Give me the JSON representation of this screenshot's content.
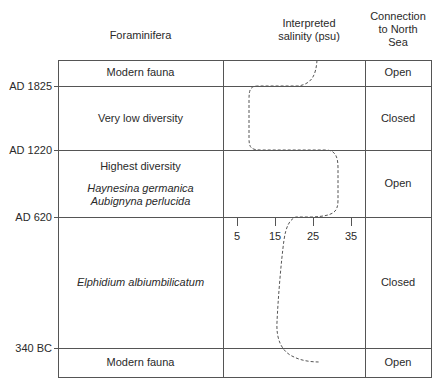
{
  "headers": {
    "foraminifera": "Foraminifera",
    "salinity_line1": "Interpreted",
    "salinity_line2": "salinity (psu)",
    "connection_line1": "Connection",
    "connection_line2": "to North",
    "connection_line3": "Sea"
  },
  "dates": {
    "d1": "AD 1825",
    "d2": "AD 1220",
    "d3": "AD 620",
    "d4": "340 BC"
  },
  "rows": [
    {
      "fauna": "Modern fauna",
      "connection": "Open"
    },
    {
      "fauna": "Very low diversity",
      "connection": "Closed"
    },
    {
      "fauna": "Highest diversity",
      "species1": "Haynesina germanica",
      "species2": "Aubignyna perlucida",
      "connection": "Open"
    },
    {
      "fauna": "Elphidium albiumbilicatum",
      "connection": "Closed"
    },
    {
      "fauna": "Modern fauna",
      "connection": "Open"
    }
  ],
  "salinity_axis": {
    "ticks": [
      "5",
      "15",
      "25",
      "35"
    ]
  },
  "colors": {
    "line": "#555555",
    "text": "#2a2a2a"
  }
}
